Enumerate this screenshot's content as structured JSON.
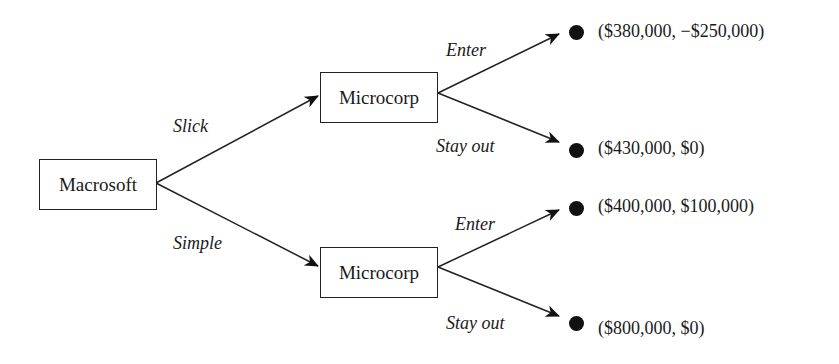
{
  "diagram": {
    "type": "game-tree",
    "root": {
      "label": "Macrosoft"
    },
    "branches": [
      {
        "action": "Slick",
        "node": {
          "label": "Microcorp"
        },
        "outcomes": [
          {
            "action": "Enter",
            "payoff": "($380,000, −$250,000)"
          },
          {
            "action": "Stay out",
            "payoff": "($430,000, $0)"
          }
        ]
      },
      {
        "action": "Simple",
        "node": {
          "label": "Microcorp"
        },
        "outcomes": [
          {
            "action": "Enter",
            "payoff": "($400,000, $100,000)"
          },
          {
            "action": "Stay out",
            "payoff": "($800,000, $0)"
          }
        ]
      }
    ],
    "colors": {
      "line": "#222222",
      "dot": "#111111",
      "text": "#1a1a1a"
    }
  }
}
